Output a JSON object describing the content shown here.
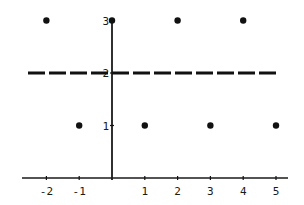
{
  "chart_data": {
    "type": "scatter",
    "title": "",
    "xlabel": "",
    "ylabel": "",
    "xlim": [
      -2.5,
      5.3
    ],
    "ylim": [
      0,
      3.1
    ],
    "grid": false,
    "legend": null,
    "x_ticks": [
      "-2",
      "-1",
      "1",
      "2",
      "3",
      "4",
      "5"
    ],
    "x_tick_values": [
      -2,
      -1,
      1,
      2,
      3,
      4,
      5
    ],
    "y_ticks": [
      "1",
      "2",
      "3"
    ],
    "y_tick_values": [
      1,
      2,
      3
    ],
    "series": [
      {
        "name": "points",
        "type": "scatter",
        "x": [
          -2,
          0,
          2,
          4,
          -1,
          1,
          3,
          5
        ],
        "y": [
          3,
          3,
          3,
          3,
          1,
          1,
          1,
          1
        ]
      },
      {
        "name": "mean line",
        "type": "line",
        "style": "dashed",
        "x": [
          -2.5,
          5
        ],
        "y": [
          2,
          2
        ]
      }
    ],
    "colors": {
      "ink": "#111111",
      "background": "#ffffff"
    }
  }
}
